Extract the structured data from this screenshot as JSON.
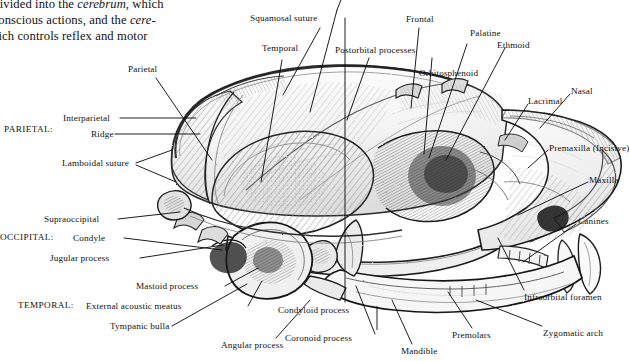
{
  "page": {
    "background": "#ffffff",
    "ink": "#101010"
  },
  "bodytext": {
    "lines": [
      {
        "pre": "s, is divided into the ",
        "em": "cerebrum,",
        "post": " which"
      },
      {
        "pre": "rols conscious actions, and the ",
        "em": "cere-",
        "post": ""
      },
      {
        "pre": "",
        "em": "n,",
        "post": " which controls reflex and motor"
      },
      {
        "pre": "ities.",
        "em": "",
        "post": ""
      }
    ]
  },
  "figure": {
    "group_labels": [
      {
        "id": "parietal-group",
        "text": "PARIETAL:"
      },
      {
        "id": "occipital-group",
        "text": "OCCIPITAL:"
      },
      {
        "id": "temporal-group",
        "text": "TEMPORAL:"
      }
    ],
    "labels": [
      {
        "id": "squamosal-suture",
        "text": "Squamosal suture"
      },
      {
        "id": "temporal",
        "text": "Temporal"
      },
      {
        "id": "postorbital-processes",
        "text": "Postorbital processes"
      },
      {
        "id": "frontal",
        "text": "Frontal"
      },
      {
        "id": "palatine",
        "text": "Palatine"
      },
      {
        "id": "ethmoid",
        "text": "Ethmoid"
      },
      {
        "id": "orbitosphenoid",
        "text": "Orbitosphenoid"
      },
      {
        "id": "lacrimal",
        "text": "Lacrimal"
      },
      {
        "id": "nasal",
        "text": "Nasal"
      },
      {
        "id": "premaxilla-incisive",
        "text": "Premaxilla (Incisive)"
      },
      {
        "id": "maxilla",
        "text": "Maxilla"
      },
      {
        "id": "canines",
        "text": "Canines"
      },
      {
        "id": "infraorbital-foramen",
        "text": "Infraorbital foramen"
      },
      {
        "id": "zygomatic-arch",
        "text": "Zygomatic arch"
      },
      {
        "id": "premolars",
        "text": "Premolars"
      },
      {
        "id": "mandible",
        "text": "Mandible"
      },
      {
        "id": "coronoid-process",
        "text": "Coronoid process"
      },
      {
        "id": "condyloid-process",
        "text": "Condyloid process"
      },
      {
        "id": "angular-process",
        "text": "Angular process"
      },
      {
        "id": "tympanic-bulla",
        "text": "Tympanic bulla"
      },
      {
        "id": "external-acoustic-meatus",
        "text": "External acoustic meatus"
      },
      {
        "id": "mastoid-process",
        "text": "Mastoid process"
      },
      {
        "id": "jugular-process",
        "text": "Jugular process"
      },
      {
        "id": "condyle",
        "text": "Condyle"
      },
      {
        "id": "supraoccipital",
        "text": "Supraoccipital"
      },
      {
        "id": "lamboidal-suture",
        "text": "Lamboidal suture"
      },
      {
        "id": "ridge",
        "text": "Ridge"
      },
      {
        "id": "interparietal",
        "text": "Interparietal"
      },
      {
        "id": "parietal",
        "text": "Parietal"
      }
    ]
  }
}
